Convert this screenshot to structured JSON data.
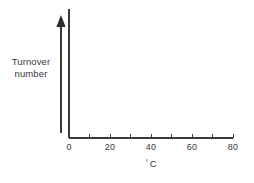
{
  "chart_data": {
    "type": "line",
    "title": "",
    "subtitle": "",
    "xlabel_degree_symbol": "°",
    "xlabel_unit": "C",
    "ylabel_line1": "Turnover",
    "ylabel_line2": "number",
    "xlim": [
      0,
      80
    ],
    "ylim": [
      0,
      1
    ],
    "x_major_ticks": [
      0,
      20,
      40,
      60,
      80
    ],
    "x_minor_ticks": [
      10,
      30,
      50,
      70
    ],
    "x_tick_labels": [
      "0",
      "20",
      "40",
      "60",
      "80"
    ],
    "y_tick_labels": [],
    "grid": false,
    "legend": null,
    "series": [],
    "annotations": [
      {
        "name": "y-direction-arrow",
        "description": "upward arrow beside the vertical axis indicating increasing turnover number"
      }
    ],
    "colors": {
      "axis": "#3a3a3a",
      "arrow": "#2b2b2b",
      "text": "#3a3a3a",
      "background": "#ffffff"
    }
  },
  "geometry": {
    "origin_x": 69,
    "origin_y": 138,
    "x_axis_end_x": 233,
    "y_axis_top_y": 9,
    "arrow_x": 61,
    "arrow_top_y": 22,
    "arrow_bottom_y": 133,
    "tick_height": 4
  }
}
